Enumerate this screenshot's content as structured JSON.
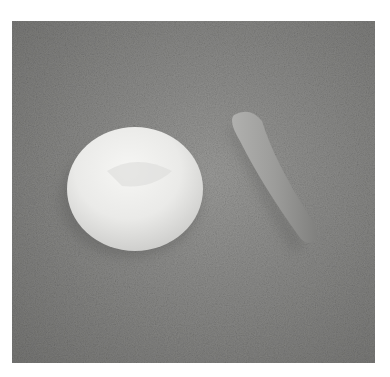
{
  "image": {
    "subject": "white clay disc and gray clay cone on textured gray surface",
    "colors": {
      "background": "#ffffff",
      "surface": "#8a8a88",
      "disc": "#ececea",
      "cone": "#9a9a98"
    }
  }
}
